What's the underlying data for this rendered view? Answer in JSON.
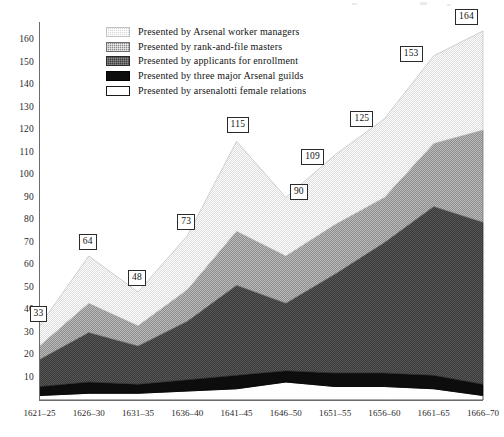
{
  "chart_data": {
    "type": "area",
    "stacked": true,
    "title": "",
    "subtitle": "",
    "xlabel": "",
    "ylabel": "",
    "categories": [
      "1621–25",
      "1626–30",
      "1631–35",
      "1636–40",
      "1641–45",
      "1646–50",
      "1651–55",
      "1656–60",
      "1661–65",
      "1666–70"
    ],
    "ylim": [
      0,
      168
    ],
    "ytick_values": [
      10,
      20,
      30,
      40,
      50,
      60,
      70,
      80,
      90,
      100,
      110,
      120,
      130,
      140,
      150,
      160
    ],
    "ytick_labels": [
      "10",
      "20",
      "30",
      "40",
      "50",
      "60",
      "70",
      "80",
      "90",
      "100",
      "110",
      "120",
      "130",
      "140",
      "150",
      "160"
    ],
    "grid": false,
    "legend_position": "upper-left-inside",
    "totals": [
      33,
      64,
      48,
      73,
      115,
      90,
      109,
      125,
      153,
      164
    ],
    "total_labels": [
      "33",
      "64",
      "48",
      "73",
      "115",
      "90",
      "109",
      "125",
      "153",
      "164"
    ],
    "series": [
      {
        "name": "Presented by arsenalotti female relations",
        "key": "relations",
        "color": "#ffffff",
        "pattern": "solid-white-outlined",
        "values": [
          2,
          3,
          3,
          4,
          5,
          8,
          6,
          6,
          5,
          2
        ]
      },
      {
        "name": "Presented by three major Arsenal guilds",
        "key": "guilds",
        "color": "#0d0d0d",
        "pattern": "solid-black",
        "values": [
          4,
          5,
          4,
          5,
          6,
          5,
          6,
          6,
          6,
          5
        ]
      },
      {
        "name": "Presented by applicants for enrollment",
        "key": "applicants",
        "color": "#3e3e3e",
        "pattern": "dark-stipple",
        "values": [
          12,
          22,
          17,
          26,
          40,
          30,
          44,
          58,
          75,
          72
        ]
      },
      {
        "name": "Presented by rank-and-file masters",
        "key": "masters",
        "color": "#8e8e8e",
        "pattern": "medium-stipple",
        "values": [
          6,
          13,
          9,
          14,
          24,
          21,
          22,
          20,
          28,
          41
        ]
      },
      {
        "name": "Presented by Arsenal worker managers",
        "key": "managers",
        "color": "#d6d6d6",
        "pattern": "light-stipple",
        "values": [
          9,
          21,
          15,
          24,
          40,
          26,
          31,
          35,
          39,
          44
        ]
      }
    ]
  },
  "legend": {
    "items": [
      {
        "label": "Presented by Arsenal worker managers",
        "swatch": "light-stipple-swatch"
      },
      {
        "label": "Presented by rank-and-file masters",
        "swatch": "medium-stipple-swatch"
      },
      {
        "label": "Presented by applicants for enrollment",
        "swatch": "dark-stipple-swatch"
      },
      {
        "label": "Presented by three major Arsenal guilds",
        "swatch": "black-swatch"
      },
      {
        "label": "Presented by arsenalotti female relations",
        "swatch": "white-outline-swatch"
      }
    ]
  }
}
